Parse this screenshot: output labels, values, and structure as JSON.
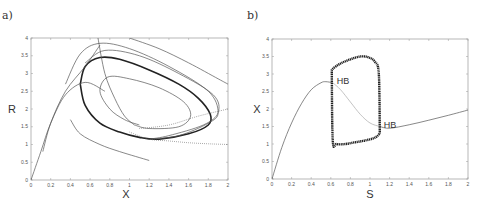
{
  "figure": {
    "panels": [
      {
        "label": "a)",
        "xlabel": "X",
        "ylabel": "R"
      },
      {
        "label": "b)",
        "xlabel": "S",
        "ylabel": "X",
        "annotations": [
          "HB",
          "HB"
        ]
      }
    ]
  },
  "chart_data": [
    {
      "type": "line",
      "title": "a)",
      "subtitle": "Phase portrait in X–R plane: trajectories converging to a stable limit cycle (bold)",
      "xlabel": "X",
      "ylabel": "R",
      "xlim": [
        0,
        2
      ],
      "ylim": [
        0,
        4
      ],
      "xticks": [
        0,
        0.2,
        0.4,
        0.6,
        0.8,
        1,
        1.2,
        1.4,
        1.6,
        1.8,
        2
      ],
      "yticks": [
        0,
        0.5,
        1,
        1.5,
        2,
        2.5,
        3,
        3.5,
        4
      ],
      "xtick_labels": [
        "0",
        "0.2",
        "0.4",
        "0.6",
        "0.8",
        "1",
        "1.2",
        "1.4",
        "1.6",
        "1.8",
        "2"
      ],
      "ytick_labels": [
        "0",
        "0.5",
        "1",
        "1.5",
        "2",
        "2.5",
        "3",
        "3.5",
        "4"
      ],
      "grid": false,
      "legend": null,
      "series": [
        {
          "name": "limit cycle (bold)",
          "x": [
            0.5,
            0.55,
            0.7,
            0.9,
            1.2,
            1.5,
            1.7,
            1.82,
            1.8,
            1.6,
            1.3,
            1.1,
            0.9,
            0.7,
            0.55,
            0.5
          ],
          "y": [
            2.7,
            3.2,
            3.45,
            3.4,
            3.1,
            2.7,
            2.3,
            1.85,
            1.55,
            1.3,
            1.15,
            1.2,
            1.35,
            1.6,
            2.1,
            2.7
          ]
        },
        {
          "name": "outer trajectory 1",
          "x": [
            0.35,
            0.5,
            0.7,
            1.0,
            1.4,
            1.8,
            1.9,
            1.8,
            1.5,
            1.2
          ],
          "y": [
            2.7,
            3.55,
            3.85,
            3.7,
            3.2,
            2.5,
            1.9,
            1.6,
            1.25,
            1.15
          ]
        },
        {
          "name": "outer trajectory 2",
          "x": [
            0.55,
            0.75,
            1.1,
            1.5,
            1.85,
            1.9,
            1.75,
            1.4,
            1.2
          ],
          "y": [
            3.3,
            3.65,
            3.5,
            3.0,
            2.4,
            1.9,
            1.55,
            1.25,
            1.15
          ]
        },
        {
          "name": "inner spiral",
          "x": [
            1.1,
            0.95,
            0.8,
            0.7,
            0.78,
            1.0,
            1.3,
            1.55,
            1.62,
            1.5,
            1.2,
            1.05
          ],
          "y": [
            1.55,
            1.7,
            2.0,
            2.5,
            2.9,
            2.85,
            2.6,
            2.2,
            1.8,
            1.5,
            1.45,
            1.55
          ]
        },
        {
          "name": "upper-right trajectory",
          "x": [
            1.0,
            1.3,
            1.6,
            1.9,
            2.0
          ],
          "y": [
            4.0,
            3.7,
            3.3,
            2.85,
            2.7
          ]
        },
        {
          "name": "left arc trajectory",
          "x": [
            0.12,
            0.2,
            0.35,
            0.55,
            0.7
          ],
          "y": [
            0.8,
            1.6,
            2.5,
            3.2,
            3.8
          ]
        },
        {
          "name": "lower arc trajectory",
          "x": [
            0.0,
            0.1,
            0.2,
            0.35,
            0.55,
            0.75
          ],
          "y": [
            0.0,
            0.8,
            1.6,
            2.4,
            2.75,
            2.5
          ]
        },
        {
          "name": "bottom trajectory",
          "x": [
            0.4,
            0.5,
            0.7,
            0.9,
            1.2
          ],
          "y": [
            1.7,
            1.3,
            1.0,
            0.8,
            0.55
          ]
        },
        {
          "name": "steep trajectory",
          "x": [
            0.68,
            0.75,
            0.85,
            0.95,
            1.05
          ],
          "y": [
            4.0,
            3.0,
            2.3,
            1.8,
            1.55
          ]
        },
        {
          "name": "dotted nullcline",
          "x": [
            1.0,
            1.2,
            1.4,
            1.6,
            1.8,
            2.0
          ],
          "y": [
            1.35,
            1.15,
            1.1,
            1.05,
            1.02,
            1.0
          ],
          "style": "dotted"
        },
        {
          "name": "right dashed",
          "x": [
            1.1,
            1.4,
            1.7,
            2.0
          ],
          "y": [
            1.45,
            1.55,
            1.8,
            2.0
          ],
          "style": "dotted"
        }
      ]
    },
    {
      "type": "line",
      "title": "b)",
      "subtitle": "Bifurcation diagram: X vs S with Hopf bifurcations (HB) and periodic orbit branch (max/min)",
      "xlabel": "S",
      "ylabel": "X",
      "xlim": [
        0,
        2
      ],
      "ylim": [
        0,
        4
      ],
      "xticks": [
        0,
        0.2,
        0.4,
        0.6,
        0.8,
        1,
        1.2,
        1.4,
        1.6,
        1.8,
        2
      ],
      "yticks": [
        0,
        0.5,
        1,
        1.5,
        2,
        2.5,
        3,
        3.5,
        4
      ],
      "xtick_labels": [
        "0",
        "0.2",
        "0.4",
        "0.6",
        "0.8",
        "1",
        "1.2",
        "1.4",
        "1.6",
        "1.8",
        "2"
      ],
      "ytick_labels": [
        "0",
        "0.5",
        "1",
        "1.5",
        "2",
        "2.5",
        "3",
        "3.5",
        "4"
      ],
      "grid": false,
      "legend": null,
      "annotations": [
        {
          "text": "HB",
          "x": 0.62,
          "y": 2.75
        },
        {
          "text": "HB",
          "x": 1.1,
          "y": 1.5
        }
      ],
      "series": [
        {
          "name": "stable equilibria (left)",
          "x": [
            0,
            0.1,
            0.2,
            0.3,
            0.4,
            0.5,
            0.55,
            0.62
          ],
          "y": [
            0,
            0.9,
            1.6,
            2.15,
            2.55,
            2.75,
            2.78,
            2.75
          ]
        },
        {
          "name": "unstable equilibria",
          "x": [
            0.62,
            0.7,
            0.8,
            0.9,
            1.0,
            1.1
          ],
          "y": [
            2.75,
            2.55,
            2.2,
            1.85,
            1.6,
            1.5
          ],
          "style": "thin-gray"
        },
        {
          "name": "stable equilibria (right)",
          "x": [
            1.1,
            1.2,
            1.4,
            1.6,
            1.8,
            2.0
          ],
          "y": [
            1.5,
            1.45,
            1.55,
            1.68,
            1.82,
            1.97
          ]
        },
        {
          "name": "periodic orbit max",
          "x": [
            0.61,
            0.62,
            0.7,
            0.8,
            0.9,
            0.98,
            1.05,
            1.09,
            1.1
          ],
          "y": [
            3.1,
            3.15,
            3.3,
            3.42,
            3.5,
            3.48,
            3.35,
            3.0,
            1.3
          ],
          "style": "bold-dotted"
        },
        {
          "name": "periodic orbit min",
          "x": [
            0.61,
            0.62,
            0.66,
            0.75,
            0.85,
            0.95,
            1.05,
            1.1
          ],
          "y": [
            3.1,
            1.1,
            1.0,
            1.0,
            1.05,
            1.1,
            1.18,
            1.3
          ],
          "style": "bold-dotted"
        }
      ]
    }
  ]
}
